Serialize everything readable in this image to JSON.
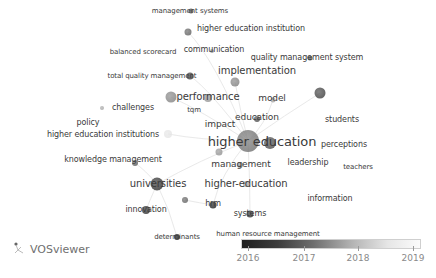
{
  "app": {
    "brand": "VOSviewer",
    "brand_icon": "vosviewer-logo-icon",
    "visualization": "overlay"
  },
  "legend": {
    "type": "color-scale",
    "min": 2016,
    "max": 2019,
    "ticks": [
      {
        "label": "2016",
        "x": 248
      },
      {
        "label": "2017",
        "x": 304
      },
      {
        "label": "2018",
        "x": 358
      },
      {
        "label": "2019",
        "x": 413
      }
    ],
    "colors": {
      "low": "#1e1e1e",
      "high": "#fbfbfb"
    }
  },
  "nodes": [
    {
      "id": "higher-education",
      "label": "higher education",
      "x": 248,
      "y": 141,
      "size": 22,
      "font": 13,
      "shade": "#7a7a7a",
      "lx": 262,
      "ly": 141
    },
    {
      "id": "management-systems",
      "label": "management systems",
      "x": 191,
      "y": 11,
      "size": 5,
      "font": 7,
      "shade": "#555555",
      "lx": 190,
      "ly": 11
    },
    {
      "id": "higher-education-institution",
      "label": "higher education institution",
      "x": 188,
      "y": 32,
      "size": 7,
      "font": 8,
      "shade": "#6a6a6a",
      "lx": 251,
      "ly": 29
    },
    {
      "id": "balanced-scorecard",
      "label": "balanced scorecard",
      "x": 0,
      "y": 0,
      "size": 0,
      "font": 7,
      "shade": "#aaaaaa",
      "lx": 143,
      "ly": 52
    },
    {
      "id": "communication",
      "label": "communication",
      "x": 212,
      "y": 51,
      "size": 4,
      "font": 8,
      "shade": "#999999",
      "lx": 214,
      "ly": 50
    },
    {
      "id": "quality-management-system",
      "label": "quality management system",
      "x": 310,
      "y": 58,
      "size": 5,
      "font": 8,
      "shade": "#555555",
      "lx": 307,
      "ly": 58
    },
    {
      "id": "total-quality-management",
      "label": "total quality management",
      "x": 190,
      "y": 76,
      "size": 7,
      "font": 7,
      "shade": "#444444",
      "lx": 152,
      "ly": 76
    },
    {
      "id": "implementation",
      "label": "implementation",
      "x": 235,
      "y": 82,
      "size": 9,
      "font": 10,
      "shade": "#888888",
      "lx": 257,
      "ly": 71
    },
    {
      "id": "performance",
      "label": "performance",
      "x": 171,
      "y": 97,
      "size": 11,
      "font": 10,
      "shade": "#8a8a8a",
      "lx": 208,
      "ly": 97
    },
    {
      "id": "performance-b",
      "label": "",
      "x": 208,
      "y": 98,
      "size": 8,
      "font": 0,
      "shade": "#9a9a9a",
      "lx": 0,
      "ly": 0
    },
    {
      "id": "model",
      "label": "model",
      "x": 273,
      "y": 100,
      "size": 5,
      "font": 9,
      "shade": "#aaaaaa",
      "lx": 272,
      "ly": 98
    },
    {
      "id": "unnamed-dark-right",
      "label": "",
      "x": 320,
      "y": 93,
      "size": 11,
      "font": 0,
      "shade": "#4a4a4a",
      "lx": 0,
      "ly": 0
    },
    {
      "id": "challenges",
      "label": "challenges",
      "x": 102,
      "y": 108,
      "size": 4,
      "font": 8,
      "shade": "#aaaaaa",
      "lx": 133,
      "ly": 108
    },
    {
      "id": "tqm",
      "label": "tqm",
      "x": 0,
      "y": 0,
      "size": 0,
      "font": 7,
      "shade": "#888888",
      "lx": 194,
      "ly": 110
    },
    {
      "id": "policy",
      "label": "policy",
      "x": 0,
      "y": 0,
      "size": 0,
      "font": 8,
      "shade": "#aaaaaa",
      "lx": 88,
      "ly": 123
    },
    {
      "id": "education",
      "label": "education",
      "x": 257,
      "y": 119,
      "size": 6,
      "font": 9,
      "shade": "#555555",
      "lx": 257,
      "ly": 117
    },
    {
      "id": "impact",
      "label": "impact",
      "x": 0,
      "y": 0,
      "size": 0,
      "font": 9,
      "shade": "#aaaaaa",
      "lx": 220,
      "ly": 124
    },
    {
      "id": "students",
      "label": "students",
      "x": 0,
      "y": 0,
      "size": 0,
      "font": 8,
      "shade": "#cccccc",
      "lx": 342,
      "ly": 120
    },
    {
      "id": "higher-education-institutions",
      "label": "higher education institutions",
      "x": 168,
      "y": 134,
      "size": 8,
      "font": 8,
      "shade": "#e6e6e6",
      "lx": 103,
      "ly": 135
    },
    {
      "id": "higher-education-b",
      "label": "",
      "x": 270,
      "y": 143,
      "size": 12,
      "font": 0,
      "shade": "#555555",
      "lx": 0,
      "ly": 0
    },
    {
      "id": "higher-education-c",
      "label": "",
      "x": 219,
      "y": 152,
      "size": 7,
      "font": 0,
      "shade": "#999999",
      "lx": 0,
      "ly": 0
    },
    {
      "id": "perceptions",
      "label": "perceptions",
      "x": 361,
      "y": 142,
      "size": 3,
      "font": 8,
      "shade": "#dddddd",
      "lx": 344,
      "ly": 145
    },
    {
      "id": "leadership",
      "label": "leadership",
      "x": 0,
      "y": 0,
      "size": 0,
      "font": 8,
      "shade": "#dddddd",
      "lx": 308,
      "ly": 163
    },
    {
      "id": "teachers",
      "label": "teachers",
      "x": 0,
      "y": 0,
      "size": 0,
      "font": 7,
      "shade": "#eeeeee",
      "lx": 358,
      "ly": 167
    },
    {
      "id": "knowledge-management",
      "label": "knowledge management",
      "x": 135,
      "y": 163,
      "size": 6,
      "font": 8,
      "shade": "#666666",
      "lx": 113,
      "ly": 160
    },
    {
      "id": "management",
      "label": "management",
      "x": 240,
      "y": 165,
      "size": 6,
      "font": 9,
      "shade": "#999999",
      "lx": 241,
      "ly": 164
    },
    {
      "id": "universities",
      "label": "universities",
      "x": 157,
      "y": 184,
      "size": 13,
      "font": 10,
      "shade": "#3c3c3c",
      "lx": 158,
      "ly": 184
    },
    {
      "id": "higher-education-hyphen",
      "label": "higher-education",
      "x": 246,
      "y": 184,
      "size": 6,
      "font": 10,
      "shade": "#aaaaaa",
      "lx": 246,
      "ly": 184
    },
    {
      "id": "unnamed-small-mid",
      "label": "",
      "x": 185,
      "y": 200,
      "size": 6,
      "font": 0,
      "shade": "#6a6a6a",
      "lx": 0,
      "ly": 0
    },
    {
      "id": "information",
      "label": "information",
      "x": 0,
      "y": 0,
      "size": 0,
      "font": 8,
      "shade": "#dddddd",
      "lx": 330,
      "ly": 199
    },
    {
      "id": "hrm",
      "label": "hrm",
      "x": 213,
      "y": 205,
      "size": 7,
      "font": 8,
      "shade": "#2a2a2a",
      "lx": 213,
      "ly": 204
    },
    {
      "id": "innovation",
      "label": "innovation",
      "x": 146,
      "y": 210,
      "size": 8,
      "font": 8,
      "shade": "#3a3a3a",
      "lx": 146,
      "ly": 210
    },
    {
      "id": "systems",
      "label": "systems",
      "x": 250,
      "y": 214,
      "size": 7,
      "font": 8,
      "shade": "#3a3a3a",
      "lx": 250,
      "ly": 214
    },
    {
      "id": "determinants",
      "label": "determinants",
      "x": 177,
      "y": 237,
      "size": 6,
      "font": 7,
      "shade": "#222222",
      "lx": 177,
      "ly": 237
    },
    {
      "id": "human-resource-management",
      "label": "human resource management",
      "x": 0,
      "y": 0,
      "size": 0,
      "font": 7,
      "shade": "#888888",
      "lx": 268,
      "ly": 234
    }
  ]
}
